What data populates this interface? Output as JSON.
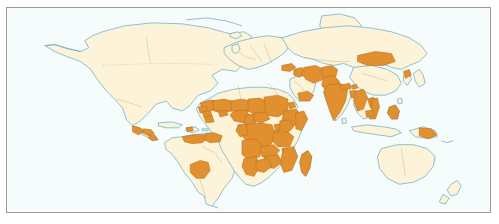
{
  "figure": {
    "kind": "world-choropleth-map",
    "frame_visible": true
  },
  "palette": {
    "ocean": "#f6fbfb",
    "land_base": "#fcf3d9",
    "land_highlight": "#e2902f",
    "coastline": "#5fa8c4",
    "admin_border": "#c8b98e",
    "admin_border_highlight": "#b8721f",
    "frame": "#9a9a9a",
    "page_background": "#ffffff"
  },
  "legend": {
    "present": false,
    "categories": [
      {
        "label": "highlighted",
        "color": "#e2902f"
      },
      {
        "label": "not highlighted",
        "color": "#fcf3d9"
      }
    ]
  },
  "regions_highlighted": [
    "Guatemala",
    "Honduras",
    "Nicaragua",
    "El Salvador",
    "Haiti",
    "Guyana",
    "Suriname",
    "French Guiana",
    "Venezuela (north)",
    "Bolivia",
    "Mauritania",
    "Mali",
    "Niger",
    "Chad",
    "Sudan",
    "Eritrea",
    "Ethiopia",
    "Somalia",
    "Senegal",
    "Guinea",
    "Sierra Leone",
    "Liberia",
    "Burkina Faso",
    "Nigeria",
    "Cameroon",
    "Central African Republic",
    "Democratic Republic of the Congo",
    "Congo",
    "Gabon",
    "Uganda",
    "Kenya",
    "Rwanda",
    "Burundi",
    "Tanzania",
    "Angola",
    "Zambia",
    "Malawi",
    "Mozambique",
    "Zimbabwe",
    "Madagascar",
    "Namibia",
    "Botswana",
    "Yemen",
    "Oman",
    "Iraq",
    "Iran",
    "Afghanistan",
    "Pakistan",
    "India",
    "Nepal",
    "Bhutan",
    "Bangladesh",
    "Myanmar",
    "Mongolia",
    "North Korea",
    "Laos",
    "Vietnam",
    "Cambodia",
    "Philippines",
    "Papua New Guinea",
    "Turkey (east)"
  ],
  "regions_not_highlighted": [
    "Canada",
    "United States",
    "Mexico",
    "Brazil",
    "Argentina",
    "Chile",
    "Peru",
    "Colombia",
    "Europe",
    "Russia",
    "China",
    "Japan",
    "South Korea",
    "Australia",
    "New Zealand",
    "South Africa",
    "Greenland",
    "Saudi Arabia",
    "Algeria",
    "Libya",
    "Egypt",
    "Indonesia",
    "Thailand",
    "Malaysia"
  ]
}
